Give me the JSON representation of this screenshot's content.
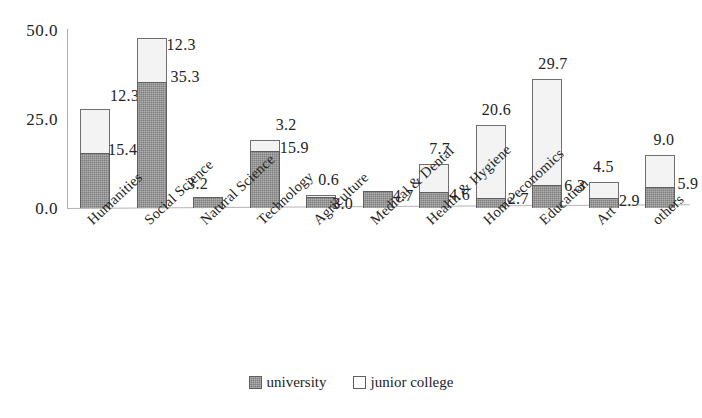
{
  "chart_data": {
    "type": "bar",
    "subtype": "stacked-bar",
    "title": "",
    "xlabel": "",
    "ylabel": "",
    "ylim": [
      0,
      50
    ],
    "yticks": [
      0,
      25,
      50
    ],
    "ytick_labels": [
      "0.0",
      "25.0",
      "50.0"
    ],
    "grid": false,
    "legend_position": "bottom-center",
    "categories": [
      "Humanities",
      "Social Science",
      "Natural Science",
      "Technology",
      "Agriculture",
      "Medical & Dental",
      "Health & Hygiene",
      "Home economics",
      "Education",
      "Art",
      "others"
    ],
    "series": [
      {
        "name": "university",
        "color": "#7d7d7d",
        "values": [
          15.4,
          35.3,
          3.2,
          15.9,
          3.0,
          4.7,
          4.6,
          2.7,
          6.3,
          2.9,
          5.9
        ]
      },
      {
        "name": "junior college",
        "color": "#f3f3f3",
        "values": [
          12.3,
          12.3,
          0.0,
          3.2,
          0.6,
          0.0,
          7.7,
          20.6,
          29.7,
          4.5,
          9.0
        ]
      }
    ],
    "point_labels": {
      "university": [
        "15.4",
        "35.3",
        "3.2",
        "15.9",
        "3.0",
        "4.7",
        "4.6",
        "2.7",
        "6.3",
        "2.9",
        "5.9"
      ],
      "junior college": [
        "12.3",
        "12.3",
        "",
        "3.2",
        "0.6",
        "",
        "7.7",
        "20.6",
        "29.7",
        "4.5",
        "9.0"
      ]
    }
  },
  "legend": {
    "items": [
      {
        "label": "university",
        "swatch": "filled-gray-square"
      },
      {
        "label": "junior college",
        "swatch": "open-white-square"
      }
    ]
  },
  "axis": {
    "y_tick_0": "0.0",
    "y_tick_1": "25.0",
    "y_tick_2": "50.0"
  }
}
